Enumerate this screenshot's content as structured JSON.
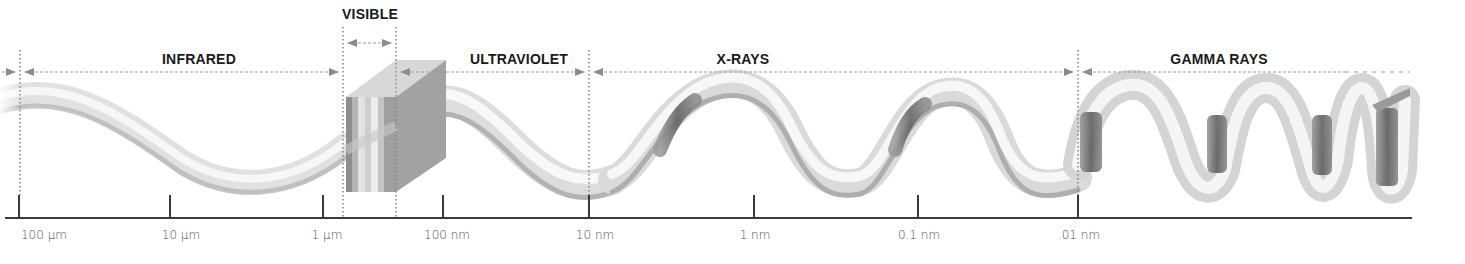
{
  "diagram": {
    "bands": [
      {
        "id": "infrared",
        "label": "INFRARED",
        "x_start": 20,
        "x_end": 343,
        "label_x": 199
      },
      {
        "id": "visible",
        "label": "VISIBLE",
        "x_start": 343,
        "x_end": 396,
        "label_x": 370
      },
      {
        "id": "ultraviolet",
        "label": "ULTRAVIOLET",
        "x_start": 396,
        "x_end": 589,
        "label_x": 519
      },
      {
        "id": "x-rays",
        "label": "X-RAYS",
        "x_start": 589,
        "x_end": 1078,
        "label_x": 743
      },
      {
        "id": "gamma-rays",
        "label": "GAMMA RAYS",
        "x_start": 1078,
        "x_end": 1410,
        "label_x": 1219
      }
    ],
    "axis": {
      "ticks": [
        {
          "label": "100 μm",
          "x": 19
        },
        {
          "label": "10 μm",
          "x": 170
        },
        {
          "label": "1 μm",
          "x": 323
        },
        {
          "label": "100 nm",
          "x": 443
        },
        {
          "label": "10 nm",
          "x": 589
        },
        {
          "label": "1 nm",
          "x": 754
        },
        {
          "label": "0.1 nm",
          "x": 918
        },
        {
          "label": ".01 nm",
          "x": 1078
        }
      ],
      "direction": "wavelength decreasing left to right"
    },
    "colors": {
      "text": "#1a1a1a",
      "tick_text": "#4a4a4a",
      "axis": "#3a3a3a",
      "divider": "#8a8a8a",
      "arrow": "#8c8c8c",
      "ribbon_light": "#f4f4f4",
      "ribbon_mid": "#c8c8c8",
      "ribbon_dark": "#6e6e6e"
    }
  }
}
